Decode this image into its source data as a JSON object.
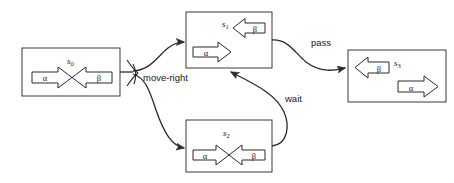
{
  "diagram": {
    "background_color": "#ffffff",
    "stroke_color": "#2a2a2a",
    "box_fill": "#ffffff",
    "states": [
      {
        "id": "s0",
        "name": "s",
        "subscript": "0",
        "box": {
          "x": 22,
          "y": 48,
          "w": 98,
          "h": 48
        },
        "label_pos": {
          "x": 71,
          "y": 62
        },
        "arrows": [
          {
            "symbol": "α",
            "direction": "right",
            "x": 32,
            "y": 68,
            "w": 40,
            "h": 20
          },
          {
            "symbol": "β",
            "direction": "left",
            "x": 72,
            "y": 68,
            "w": 40,
            "h": 20
          }
        ]
      },
      {
        "id": "s1",
        "name": "s",
        "subscript": "1",
        "box": {
          "x": 186,
          "y": 12,
          "w": 86,
          "h": 56
        },
        "label_pos": {
          "x": 226,
          "y": 25
        },
        "arrows": [
          {
            "symbol": "β",
            "direction": "left",
            "x": 229,
            "y": 20,
            "w": 36,
            "h": 18
          },
          {
            "symbol": "α",
            "direction": "right",
            "x": 193,
            "y": 43,
            "w": 38,
            "h": 19
          }
        ]
      },
      {
        "id": "s2",
        "name": "s",
        "subscript": "2",
        "box": {
          "x": 186,
          "y": 120,
          "w": 86,
          "h": 52
        },
        "label_pos": {
          "x": 227,
          "y": 134
        },
        "arrows": [
          {
            "symbol": "α",
            "direction": "right",
            "x": 193,
            "y": 146,
            "w": 38,
            "h": 19
          },
          {
            "symbol": "β",
            "direction": "left",
            "x": 231,
            "y": 146,
            "w": 36,
            "h": 19
          }
        ]
      },
      {
        "id": "s3",
        "name": "s",
        "subscript": "3",
        "box": {
          "x": 348,
          "y": 50,
          "w": 98,
          "h": 52
        },
        "label_pos": {
          "x": 398,
          "y": 64
        },
        "arrows": [
          {
            "symbol": "β",
            "direction": "left",
            "x": 354,
            "y": 58,
            "w": 36,
            "h": 19
          },
          {
            "symbol": "α",
            "direction": "right",
            "x": 400,
            "y": 80,
            "w": 40,
            "h": 19
          }
        ]
      }
    ],
    "transitions": [
      {
        "id": "move-right",
        "label": "move-right",
        "label_pos": {
          "x": 143,
          "y": 81
        },
        "from": "s0",
        "to": "s1 and s2"
      },
      {
        "id": "pass",
        "label": "pass",
        "label_pos": {
          "x": 311,
          "y": 46
        },
        "from": "s1",
        "to": "s3"
      },
      {
        "id": "wait",
        "label": "wait",
        "label_pos": {
          "x": 285,
          "y": 102
        },
        "from": "s2",
        "to": "s1"
      }
    ]
  }
}
